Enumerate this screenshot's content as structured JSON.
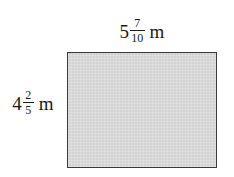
{
  "figure": {
    "background_color": "#ffffff",
    "shape": {
      "kind": "rectangle",
      "fill_color": "#d2d2d2",
      "stroke_color": "#3a3a3a"
    },
    "labels": {
      "top": {
        "role": "width",
        "whole": "5",
        "numerator": "7",
        "denominator": "10",
        "unit": "m",
        "full_text": "5 7/10 m"
      },
      "left": {
        "role": "height",
        "whole": "4",
        "numerator": "2",
        "denominator": "5",
        "unit": "m",
        "full_text": "4 2/5 m"
      }
    }
  }
}
